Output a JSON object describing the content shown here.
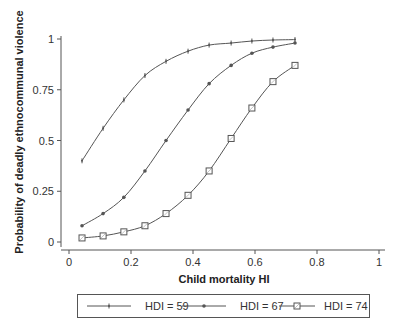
{
  "chart_data": {
    "type": "line",
    "title": "",
    "xlabel": "Child mortality HI",
    "ylabel": "Probability of deadly ethnocommunal violence",
    "xlim": [
      0,
      1
    ],
    "ylim": [
      0,
      1
    ],
    "xticks": [
      0,
      0.2,
      0.4,
      0.6,
      0.8,
      1
    ],
    "xtick_labels": [
      "0",
      "0.2",
      "0.4",
      "0.6",
      "0.8",
      "1"
    ],
    "yticks": [
      0,
      0.25,
      0.5,
      0.75,
      1
    ],
    "ytick_labels": [
      "0",
      "0.25",
      "0.5",
      "0.75",
      "1"
    ],
    "grid": false,
    "legend_position": "bottom",
    "x": [
      0.042,
      0.11,
      0.177,
      0.245,
      0.313,
      0.384,
      0.452,
      0.523,
      0.59,
      0.658,
      0.729
    ],
    "series": [
      {
        "name": "HDI = 59",
        "marker": "plus",
        "values": [
          0.4,
          0.56,
          0.7,
          0.82,
          0.89,
          0.94,
          0.97,
          0.98,
          0.99,
          0.995,
          0.997
        ]
      },
      {
        "name": "HDI = 67",
        "marker": "dot",
        "values": [
          0.08,
          0.14,
          0.22,
          0.35,
          0.5,
          0.65,
          0.78,
          0.87,
          0.93,
          0.96,
          0.98
        ]
      },
      {
        "name": "HDI = 74",
        "marker": "square",
        "values": [
          0.02,
          0.03,
          0.05,
          0.08,
          0.14,
          0.23,
          0.35,
          0.51,
          0.66,
          0.79,
          0.87
        ]
      }
    ]
  },
  "colors": {
    "line": "#555555",
    "axis": "#555555",
    "text": "#333333",
    "background": "#ffffff"
  }
}
